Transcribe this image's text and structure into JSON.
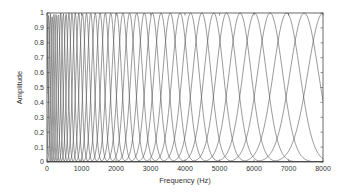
{
  "chart_data": {
    "type": "line",
    "title": "",
    "xlabel": "Frequency (Hz)",
    "ylabel": "Amplitude",
    "xlim": [
      0,
      8000
    ],
    "ylim": [
      0,
      1
    ],
    "xticks": [
      0,
      1000,
      2000,
      3000,
      4000,
      5000,
      6000,
      7000,
      8000
    ],
    "xtick_labels": [
      "0",
      "1000",
      "2000",
      "3000",
      "4000",
      "5000",
      "6000",
      "7000",
      "8000"
    ],
    "yticks": [
      0,
      0.1,
      0.2,
      0.3,
      0.4,
      0.5,
      0.6,
      0.7,
      0.8,
      0.9,
      1
    ],
    "ytick_labels": [
      "0",
      "0.1",
      "0.2",
      "0.3",
      "0.4",
      "0.5",
      "0.6",
      "0.7",
      "0.8",
      "0.9",
      "1"
    ],
    "grid": false,
    "legend": null,
    "series_count": 40,
    "filter_shape": "gaussian",
    "center_frequency_range_hz": [
      0,
      8000
    ],
    "peak_amplitude": 1,
    "line_color": "#555555"
  },
  "plot": {
    "left": 47,
    "right": 323,
    "top": 13,
    "bottom": 162
  }
}
